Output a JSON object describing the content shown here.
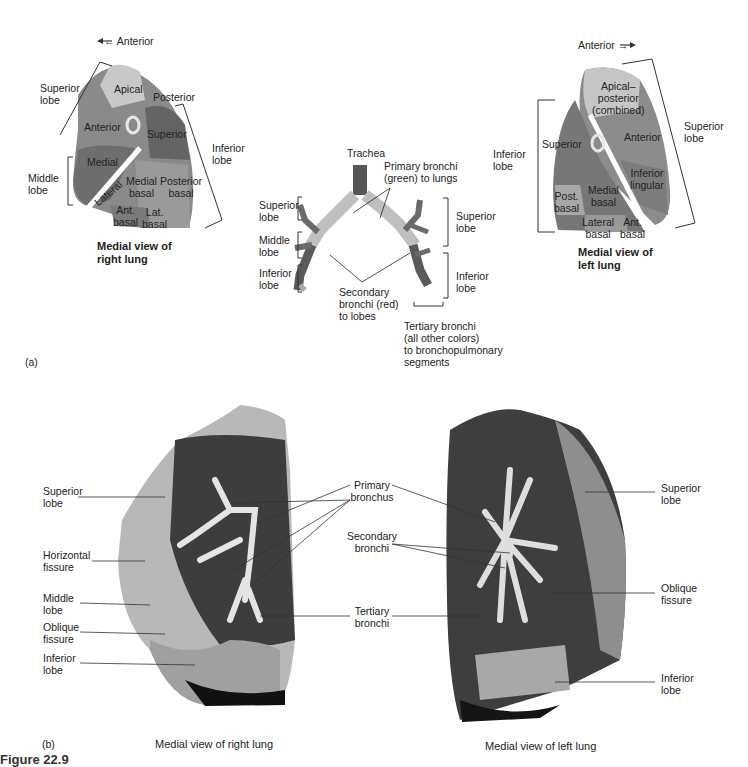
{
  "panel_a": {
    "label": "(a)",
    "right_lung": {
      "direction": "← Anterior",
      "title": "Medial view of\nright lung",
      "lobes": {
        "superior": "Superior\nlobe",
        "middle": "Middle\nlobe",
        "inferior": "Inferior\nlobe"
      },
      "segments": [
        "Apical",
        "Posterior",
        "Anterior",
        "Superior",
        "Medial",
        "Lateral",
        "Medial\nbasal",
        "Posterior\nbasal",
        "Ant.\nbasal",
        "Lat.\nbasal"
      ]
    },
    "bronchial_tree": {
      "trachea": "Trachea",
      "primary": "Primary bronchi\n(green) to lungs",
      "secondary": "Secondary\nbronchi (red)\nto lobes",
      "tertiary": "Tertiary bronchi\n(all other colors)\nto bronchopulmonary\nsegments",
      "left_side_lobes": [
        "Superior\nlobe",
        "Middle\nlobe",
        "Inferior\nlobe"
      ],
      "right_side_lobes": [
        "Superior\nlobe",
        "Inferior\nlobe"
      ]
    },
    "left_lung": {
      "direction": "Anterior →",
      "title": "Medial view of\nleft lung",
      "lobes": {
        "superior": "Superior\nlobe",
        "inferior": "Inferior\nlobe"
      },
      "segments": [
        "Apical–\nposterior\n(combined)",
        "Anterior",
        "Superior",
        "Inferior\nlingular",
        "Post.\nbasal",
        "Medial\nbasal",
        "Lateral\nbasal",
        "Ant.\nbasal"
      ]
    }
  },
  "panel_b": {
    "label": "(b)",
    "right_photo": {
      "caption": "Medial view of right lung",
      "labels": [
        "Superior\nlobe",
        "Horizontal\nfissure",
        "Middle\nlobe",
        "Oblique\nfissure",
        "Inferior\nlobe"
      ]
    },
    "center_labels": [
      "Primary\nbronchus",
      "Secondary\nbronchi",
      "Tertiary\nbronchi"
    ],
    "left_photo": {
      "caption": "Medial view of left lung",
      "labels": [
        "Superior\nlobe",
        "Oblique\nfissure",
        "Inferior\nlobe"
      ]
    }
  },
  "figure_label": "Figure 22.9",
  "colors": {
    "dark_segment": "#6b6b6b",
    "mid_segment": "#8a8a8a",
    "light_segment": "#c4c4c4",
    "photo_dark": "#3a3a3a",
    "photo_light": "#bdbdbd"
  }
}
